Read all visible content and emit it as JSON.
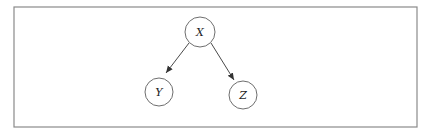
{
  "diagram": {
    "type": "directed-graph",
    "frame": {
      "x": 14,
      "y": 7,
      "width": 403,
      "height": 120
    },
    "nodes": [
      {
        "id": "X",
        "label": "X",
        "cx": 200,
        "cy": 32,
        "r": 15
      },
      {
        "id": "Y",
        "label": "Y",
        "cx": 159,
        "cy": 92,
        "r": 14
      },
      {
        "id": "Z",
        "label": "Z",
        "cx": 243,
        "cy": 95,
        "r": 14
      }
    ],
    "edges": [
      {
        "from": "X",
        "to": "Y"
      },
      {
        "from": "X",
        "to": "Z"
      }
    ]
  }
}
